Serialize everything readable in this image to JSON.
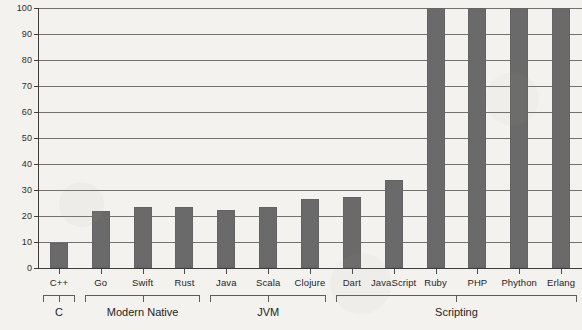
{
  "chart_data": {
    "type": "bar",
    "title": "",
    "xlabel": "",
    "ylabel": "",
    "ylim": [
      0,
      100
    ],
    "grid": true,
    "legend": "none",
    "bar_color": "#6a6a6a",
    "background_color": "#f3f2ef",
    "axis_color": "#3d3d3d",
    "yticks": [
      0,
      10,
      20,
      30,
      40,
      50,
      60,
      70,
      80,
      90,
      100
    ],
    "ytick_labels": [
      "0",
      "10",
      "20",
      "30",
      "40",
      "50",
      "60",
      "70",
      "80",
      "90",
      "100"
    ],
    "categories": [
      "C++",
      "Go",
      "Swift",
      "Rust",
      "Java",
      "Scala",
      "Clojure",
      "Dart",
      "JavaScript",
      "Ruby",
      "PHP",
      "Phython",
      "Erlang"
    ],
    "values": [
      9.5,
      22,
      23.5,
      23.5,
      22.5,
      23.5,
      26.5,
      27.5,
      34,
      100,
      100,
      100,
      100
    ],
    "clipped_at_max": [
      "Ruby",
      "PHP",
      "Phython",
      "Erlang"
    ],
    "groups": [
      {
        "label": "C",
        "members": [
          "C++"
        ]
      },
      {
        "label": "Modern Native",
        "members": [
          "Go",
          "Swift",
          "Rust"
        ]
      },
      {
        "label": "JVM",
        "members": [
          "Java",
          "Scala",
          "Clojure"
        ]
      },
      {
        "label": "Scripting",
        "members": [
          "Dart",
          "JavaScript",
          "Ruby",
          "PHP",
          "Phython",
          "Erlang"
        ]
      }
    ]
  }
}
